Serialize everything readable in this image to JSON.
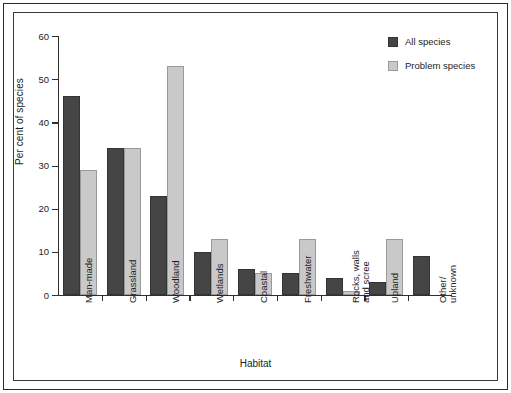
{
  "chart_data": {
    "type": "bar",
    "title": "",
    "xlabel": "Habitat",
    "ylabel": "Per cent of species",
    "ylim": [
      0,
      60
    ],
    "yticks": [
      0,
      10,
      20,
      30,
      40,
      50,
      60
    ],
    "ytick_labels": [
      "0",
      "10",
      "20",
      "30",
      "40",
      "50",
      "60"
    ],
    "grid": false,
    "legend_position": "top-right",
    "categories": [
      "Man-made",
      "Grassland",
      "Woodland",
      "Wetlands",
      "Coastal",
      "Freshwater",
      "Rocks, walls\nand scree",
      "Upland",
      "Other/\nunknown"
    ],
    "series": [
      {
        "name": "All species",
        "color": "#454545",
        "values": [
          46,
          34,
          23,
          10,
          6,
          5,
          4,
          3,
          9
        ]
      },
      {
        "name": "Problem species",
        "color": "#c9c9c9",
        "values": [
          29,
          34,
          53,
          13,
          5,
          13,
          1,
          13,
          0
        ]
      }
    ]
  },
  "legend": {
    "items": [
      {
        "label": "All species",
        "swatch": "dark-grey-swatch"
      },
      {
        "label": "Problem species",
        "swatch": "light-grey-swatch"
      }
    ]
  },
  "axes": {
    "y_title": "Per cent of species",
    "x_title": "Habitat"
  }
}
